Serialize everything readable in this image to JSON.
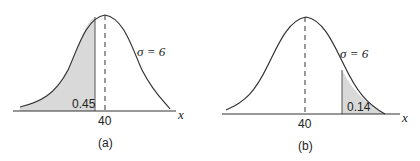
{
  "panels": [
    {
      "id": "a",
      "caption": "(a)",
      "mean_label": "40",
      "sigma_label": "σ = 6",
      "area_label": "0.45",
      "axis_label": "x",
      "shaded_region": "left tail up to value below mean"
    },
    {
      "id": "b",
      "caption": "(b)",
      "mean_label": "40",
      "sigma_label": "σ = 6",
      "area_label": "0.14",
      "axis_label": "x",
      "shaded_region": "right tail beyond value above mean"
    }
  ],
  "colors": {
    "curve": "#333333",
    "shade": "#d9d9d9",
    "axis": "#333333"
  }
}
